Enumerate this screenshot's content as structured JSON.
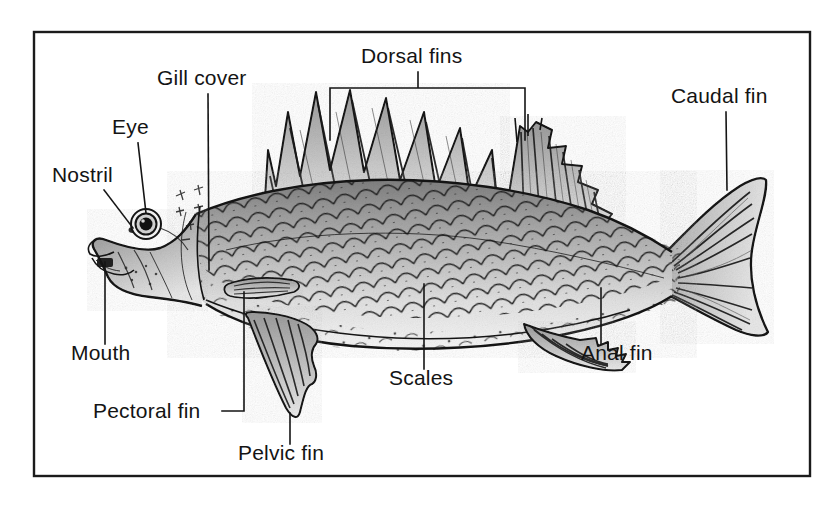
{
  "figure": {
    "kind": "labelled-anatomy-diagram",
    "orientation": "left-facing, lateral view",
    "background_color": "#ffffff",
    "ink_color": "#141414",
    "frame": {
      "present": true,
      "stroke_color": "#1b1b1b",
      "x": 34,
      "y": 32,
      "width": 776,
      "height": 444
    },
    "palette": {
      "paper": "#ffffff",
      "outline": "#141414",
      "body_light": "#e6e6e6",
      "body_mid": "#b4b4b4",
      "body_dark": "#8d8d8d",
      "belly": "#f2f2f2",
      "fin_light": "#d4d4d4",
      "fin_dark": "#8a8a8a",
      "eye_pupil": "#111111"
    }
  },
  "labels": [
    {
      "id": "nostril",
      "text": "Nostril",
      "text_x": 52,
      "text_y": 182,
      "anchor": "start",
      "leader": "M 104 190 L 133 228",
      "points_to": "nostril opening on the snout"
    },
    {
      "id": "eye",
      "text": "Eye",
      "text_x": 112,
      "text_y": 134,
      "anchor": "start",
      "leader": "M 138 143 L 146 213",
      "points_to": "eye"
    },
    {
      "id": "gill-cover",
      "text": "Gill cover",
      "text_x": 157,
      "text_y": 85,
      "anchor": "start",
      "leader": "M 208 94 L 209 270",
      "points_to": "operculum / gill cover"
    },
    {
      "id": "dorsal-fins",
      "text": "Dorsal fins",
      "text_x": 361,
      "text_y": 63,
      "anchor": "start",
      "leader": "M 418 72 L 418 88 M 330 88 L 525 88 M 330 88 L 330 140 M 525 88 L 525 140",
      "points_to": "spiny first dorsal fin and soft second dorsal fin"
    },
    {
      "id": "caudal-fin",
      "text": "Caudal fin",
      "text_x": 671,
      "text_y": 103,
      "anchor": "start",
      "leader": "M 726 112 L 727 190",
      "points_to": "tail fin"
    },
    {
      "id": "mouth",
      "text": "Mouth",
      "text_x": 71,
      "text_y": 360,
      "anchor": "start",
      "leader": "M 105 344 L 105 262",
      "points_to": "mouth"
    },
    {
      "id": "pectoral-fin",
      "text": "Pectoral fin",
      "text_x": 93,
      "text_y": 418,
      "anchor": "start",
      "leader": "M 222 411 L 244 411 L 244 292",
      "points_to": "pectoral fin behind the gill cover"
    },
    {
      "id": "pelvic-fin",
      "text": "Pelvic fin",
      "text_x": 238,
      "text_y": 460,
      "anchor": "start",
      "leader": "M 290 444 L 290 413",
      "points_to": "pelvic fin on the underside"
    },
    {
      "id": "scales",
      "text": "Scales",
      "text_x": 389,
      "text_y": 385,
      "anchor": "start",
      "leader": "M 424 369 L 424 284",
      "points_to": "scales covering the flank"
    },
    {
      "id": "anal-fin",
      "text": "Anal fin",
      "text_x": 581,
      "text_y": 360,
      "anchor": "start",
      "leader": "M 601 344 L 601 288",
      "points_to": "anal fin"
    }
  ],
  "parts": [
    "Nostril",
    "Eye",
    "Gill cover",
    "Dorsal fins",
    "Caudal fin",
    "Mouth",
    "Pectoral fin",
    "Pelvic fin",
    "Scales",
    "Anal fin"
  ]
}
